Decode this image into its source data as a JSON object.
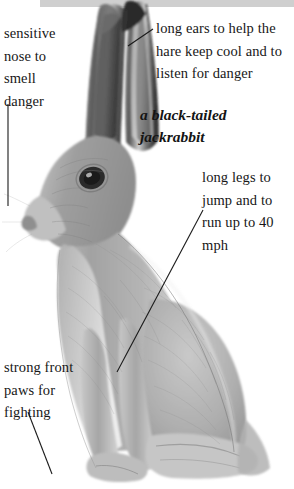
{
  "figure": {
    "title": "a black-tailed\njackrabbit",
    "subject": "black-tailed jackrabbit",
    "style": "grayscale pencil illustration"
  },
  "annotations": [
    {
      "id": "nose",
      "text": "sensitive\nnose to\nsmell\ndanger",
      "points_to": "nose"
    },
    {
      "id": "ears",
      "text": "long ears to help the\nhare keep cool and to\nlisten for danger",
      "points_to": "ear"
    },
    {
      "id": "legs",
      "text": "long legs to\njump and to\nrun up to 40\nmph",
      "points_to": "hind-leg"
    },
    {
      "id": "paws",
      "text": "strong front\npaws for\nfighting",
      "points_to": "front-paw"
    }
  ],
  "colors": {
    "background": "#ffffff",
    "text": "#171717",
    "leader_line": "#1a1a1a",
    "top_band": "#cfcfcf",
    "fur_light": "#d8d8d8",
    "fur_mid": "#a8a8a8",
    "fur_dark": "#6e6e6e",
    "ear_dark": "#3a3a3a"
  }
}
